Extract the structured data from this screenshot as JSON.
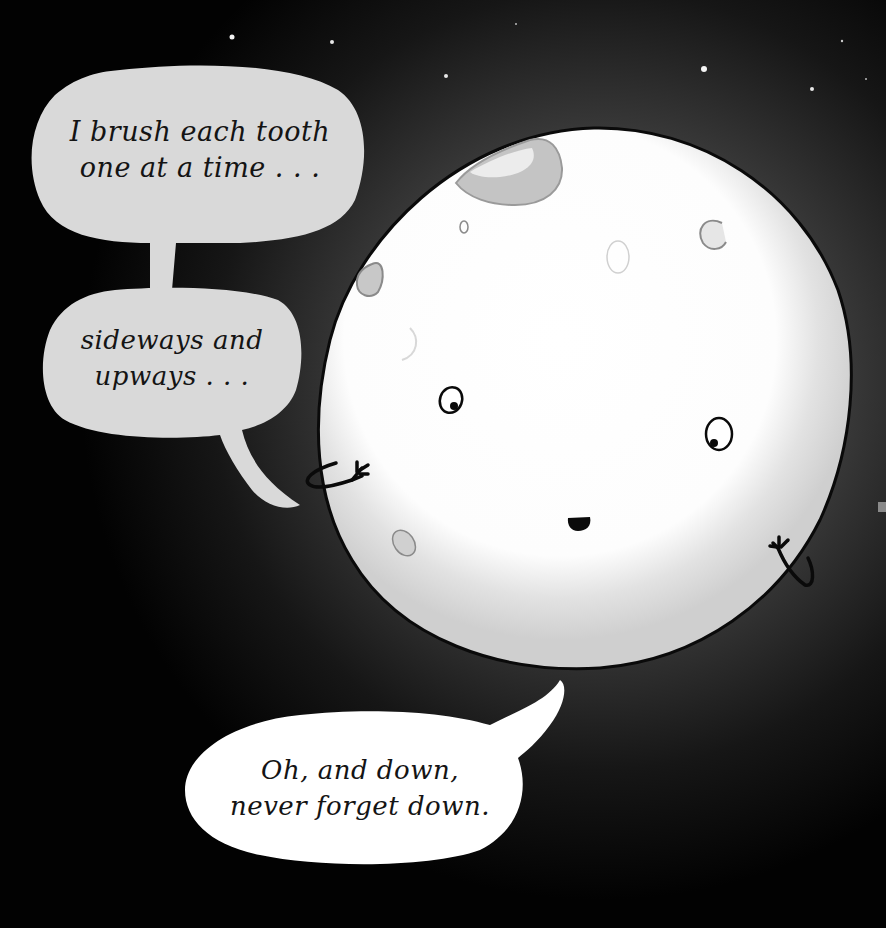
{
  "scene": {
    "description": "Cartoon moon character floating in a dark starry sky, speaking through three speech bubbles",
    "background_color": "#020202",
    "glow_color": "#4a4a4a",
    "moon_color": "#ffffff",
    "moon_shade_color": "#d4d4d4",
    "outline_color": "#0a0a0a"
  },
  "bubbles": [
    {
      "id": "bubble-1",
      "fill": "#d9d9d9",
      "lines": [
        "I brush each tooth",
        "one at a time . . ."
      ]
    },
    {
      "id": "bubble-2",
      "fill": "#d9d9d9",
      "lines": [
        "sideways and",
        "upways . . ."
      ]
    },
    {
      "id": "bubble-3",
      "fill": "#ffffff",
      "lines": [
        "Oh, and down,",
        "never forget down."
      ]
    }
  ],
  "character": {
    "name": "moon",
    "expression": "smiling, eyes looking down",
    "arms": 2,
    "craters": 7
  },
  "stars": [
    {
      "x": 232,
      "y": 37,
      "r": 2.5
    },
    {
      "x": 332,
      "y": 42,
      "r": 2
    },
    {
      "x": 446,
      "y": 76,
      "r": 2
    },
    {
      "x": 516,
      "y": 24,
      "r": 1
    },
    {
      "x": 704,
      "y": 69,
      "r": 3
    },
    {
      "x": 812,
      "y": 89,
      "r": 2
    },
    {
      "x": 842,
      "y": 41,
      "r": 1.2
    },
    {
      "x": 866,
      "y": 79,
      "r": 1
    }
  ]
}
